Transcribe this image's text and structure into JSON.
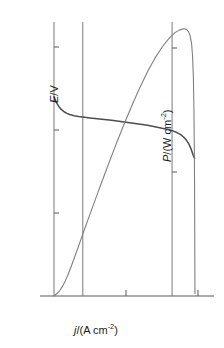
{
  "chart_data": {
    "type": "line",
    "title": "",
    "subtitle": "",
    "xlabel": "j/(A cm-2)",
    "xlabel_parts": {
      "symbol": "j",
      "slash": "/(A cm",
      "exponent": "-2",
      "close": ")"
    },
    "ylabel_left": "E/V",
    "ylabel_left_parts": {
      "symbol": "E",
      "rest": "/V"
    },
    "ylabel_right": "P/(W cm-2)",
    "ylabel_right_parts": {
      "symbol": "P",
      "rest": "/(W cm",
      "exponent": "-2",
      "close": ")"
    },
    "xlim": [
      0,
      1.05
    ],
    "ylim_left": [
      0,
      1.7
    ],
    "ylim_right": [
      0,
      1.15
    ],
    "xticks": [
      0,
      0.5,
      1.0
    ],
    "xticklabels": [
      "0",
      "0.5",
      "1.0"
    ],
    "yticks_left": [
      0,
      0.5,
      1.0,
      1.5
    ],
    "yticklabels_left": [
      "0",
      "0.5",
      "1.0",
      "1.5"
    ],
    "yticks_right": [
      0.5,
      1.0
    ],
    "yticklabels_right": [
      "0.5",
      "1.0"
    ],
    "grid": false,
    "legend": "none",
    "vertical_rules": [
      0.0,
      0.2,
      0.82
    ],
    "series": [
      {
        "name": "E",
        "axis": "left",
        "color": "#4d4d4d",
        "points": [
          [
            0.0,
            1.2
          ],
          [
            0.01,
            1.178
          ],
          [
            0.02,
            1.16
          ],
          [
            0.035,
            1.14
          ],
          [
            0.05,
            1.124
          ],
          [
            0.07,
            1.11
          ],
          [
            0.09,
            1.1
          ],
          [
            0.11,
            1.093
          ],
          [
            0.14,
            1.086
          ],
          [
            0.17,
            1.081
          ],
          [
            0.2,
            1.078
          ],
          [
            0.25,
            1.073
          ],
          [
            0.3,
            1.068
          ],
          [
            0.35,
            1.063
          ],
          [
            0.4,
            1.058
          ],
          [
            0.45,
            1.053
          ],
          [
            0.5,
            1.047
          ],
          [
            0.55,
            1.041
          ],
          [
            0.6,
            1.035
          ],
          [
            0.65,
            1.028
          ],
          [
            0.7,
            1.02
          ],
          [
            0.75,
            1.011
          ],
          [
            0.79,
            1.003
          ],
          [
            0.82,
            0.996
          ],
          [
            0.85,
            0.986
          ],
          [
            0.88,
            0.972
          ],
          [
            0.9,
            0.958
          ],
          [
            0.92,
            0.938
          ],
          [
            0.935,
            0.918
          ],
          [
            0.945,
            0.9
          ],
          [
            0.955,
            0.878
          ],
          [
            0.962,
            0.86
          ],
          [
            0.968,
            0.845
          ],
          [
            0.972,
            0.836
          ],
          [
            0.975,
            0.832
          ],
          [
            0.977,
            0.83
          ]
        ]
      },
      {
        "name": "P",
        "axis": "right",
        "color": "#808080",
        "points": [
          [
            0.0,
            0.0
          ],
          [
            0.02,
            0.01
          ],
          [
            0.04,
            0.022
          ],
          [
            0.06,
            0.04
          ],
          [
            0.08,
            0.063
          ],
          [
            0.1,
            0.09
          ],
          [
            0.12,
            0.12
          ],
          [
            0.14,
            0.152
          ],
          [
            0.17,
            0.2
          ],
          [
            0.2,
            0.25
          ],
          [
            0.25,
            0.33
          ],
          [
            0.3,
            0.41
          ],
          [
            0.35,
            0.488
          ],
          [
            0.4,
            0.565
          ],
          [
            0.45,
            0.64
          ],
          [
            0.5,
            0.712
          ],
          [
            0.55,
            0.78
          ],
          [
            0.6,
            0.845
          ],
          [
            0.65,
            0.905
          ],
          [
            0.7,
            0.958
          ],
          [
            0.75,
            1.003
          ],
          [
            0.8,
            1.04
          ],
          [
            0.84,
            1.062
          ],
          [
            0.87,
            1.072
          ],
          [
            0.9,
            1.078
          ],
          [
            0.92,
            1.075
          ],
          [
            0.935,
            1.065
          ],
          [
            0.945,
            1.05
          ],
          [
            0.955,
            1.02
          ],
          [
            0.962,
            0.97
          ],
          [
            0.968,
            0.88
          ],
          [
            0.972,
            0.74
          ],
          [
            0.975,
            0.56
          ],
          [
            0.977,
            0.33
          ],
          [
            0.978,
            0.12
          ],
          [
            0.979,
            0.01
          ]
        ]
      }
    ]
  }
}
